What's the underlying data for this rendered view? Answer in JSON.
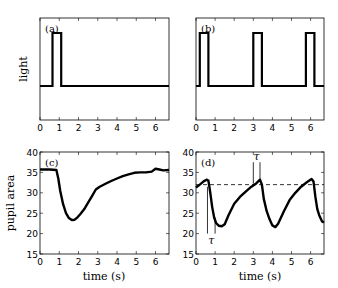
{
  "chart_data": [
    {
      "panel": "a",
      "type": "line",
      "title": "(a)",
      "xlabel": "",
      "ylabel": "light",
      "xlim": [
        0,
        6.7
      ],
      "xticks": [
        0,
        1,
        2,
        3,
        4,
        5,
        6
      ],
      "yticks": [],
      "grid": false,
      "series": [
        {
          "name": "light stimulus",
          "x": [
            0,
            0.65,
            0.65,
            1.1,
            1.1,
            6.7
          ],
          "y": [
            0,
            0,
            1,
            1,
            0,
            0
          ]
        }
      ]
    },
    {
      "panel": "b",
      "type": "line",
      "title": "(b)",
      "xlabel": "",
      "ylabel": "",
      "xlim": [
        0,
        6.7
      ],
      "xticks": [
        0,
        1,
        2,
        3,
        4,
        5,
        6
      ],
      "yticks": [],
      "grid": false,
      "series": [
        {
          "name": "light stimulus",
          "x": [
            0,
            0.2,
            0.2,
            0.65,
            0.65,
            3.0,
            3.0,
            3.45,
            3.45,
            5.75,
            5.75,
            6.2,
            6.2,
            6.7
          ],
          "y": [
            0,
            0,
            1,
            1,
            0,
            0,
            1,
            1,
            0,
            0,
            1,
            1,
            0,
            0
          ]
        }
      ]
    },
    {
      "panel": "c",
      "type": "line",
      "title": "(c)",
      "xlabel": "time (s)",
      "ylabel": "pupil area",
      "xlim": [
        0,
        6.7
      ],
      "ylim": [
        15,
        40
      ],
      "xticks": [
        0,
        1,
        2,
        3,
        4,
        5,
        6
      ],
      "yticks": [
        15,
        20,
        25,
        30,
        35,
        40
      ],
      "grid": false,
      "series": [
        {
          "name": "pupil area",
          "x": [
            0,
            0.5,
            0.85,
            0.95,
            1.05,
            1.2,
            1.35,
            1.5,
            1.65,
            1.8,
            1.95,
            2.1,
            2.3,
            2.5,
            2.7,
            2.9,
            3.1,
            3.4,
            3.7,
            4.0,
            4.3,
            4.6,
            4.9,
            5.2,
            5.5,
            5.8,
            6.0,
            6.2,
            6.4,
            6.7
          ],
          "y": [
            35.7,
            35.7,
            35.6,
            33.5,
            30.5,
            27.2,
            25.0,
            23.8,
            23.3,
            23.4,
            24.0,
            24.8,
            26.0,
            27.6,
            29.2,
            30.8,
            31.5,
            32.2,
            32.9,
            33.5,
            34.1,
            34.5,
            34.9,
            35.0,
            35.0,
            35.2,
            35.9,
            35.7,
            35.5,
            35.6
          ]
        }
      ]
    },
    {
      "panel": "d",
      "type": "line",
      "title": "(d)",
      "xlabel": "time (s)",
      "ylabel": "",
      "xlim": [
        0,
        6.7
      ],
      "ylim": [
        15,
        40
      ],
      "xticks": [
        0,
        1,
        2,
        3,
        4,
        5,
        6
      ],
      "yticks": [
        15,
        20,
        25,
        30,
        35,
        40
      ],
      "grid": false,
      "reference_line": {
        "y": 32,
        "style": "dashed"
      },
      "annotations": [
        {
          "text": "τ",
          "x_start": 0.6,
          "x_end": 1.0,
          "position": "below"
        },
        {
          "text": "τ",
          "x_start": 3.0,
          "x_end": 3.35,
          "position": "above"
        }
      ],
      "series": [
        {
          "name": "pupil area",
          "x": [
            0,
            0.2,
            0.4,
            0.55,
            0.65,
            0.75,
            0.85,
            0.95,
            1.05,
            1.2,
            1.35,
            1.5,
            1.7,
            2.0,
            2.3,
            2.6,
            2.9,
            3.15,
            3.35,
            3.45,
            3.55,
            3.7,
            3.85,
            4.0,
            4.15,
            4.3,
            4.6,
            4.9,
            5.2,
            5.5,
            5.8,
            6.05,
            6.15,
            6.25,
            6.35,
            6.45,
            6.6,
            6.7
          ],
          "y": [
            31.3,
            32.0,
            32.8,
            33.2,
            33.0,
            30.0,
            26.5,
            24.0,
            22.6,
            21.9,
            21.8,
            22.3,
            24.5,
            27.3,
            29.0,
            30.3,
            31.5,
            32.3,
            33.2,
            32.0,
            28.5,
            25.5,
            23.5,
            22.0,
            21.6,
            22.4,
            25.5,
            28.2,
            30.0,
            31.5,
            32.6,
            33.4,
            32.8,
            29.0,
            26.0,
            24.5,
            23.0,
            22.7
          ]
        }
      ]
    }
  ],
  "panels": {
    "a": {
      "label": "(a)",
      "ylabel": "light"
    },
    "b": {
      "label": "(b)"
    },
    "c": {
      "label": "(c)",
      "ylabel": "pupil area",
      "xlabel": "time (s)"
    },
    "d": {
      "label": "(d)",
      "xlabel": "time (s)",
      "tau_low": "τ",
      "tau_high": "τ"
    }
  },
  "ticks": {
    "x": [
      "0",
      "1",
      "2",
      "3",
      "4",
      "5",
      "6"
    ],
    "y": [
      "15",
      "20",
      "25",
      "30",
      "35",
      "40"
    ]
  }
}
